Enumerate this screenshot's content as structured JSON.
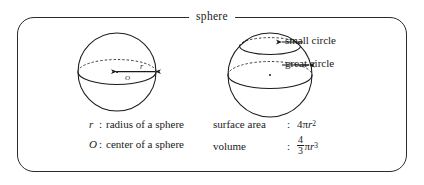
{
  "figure": {
    "legend_title": "sphere",
    "border_color": "#2a2a2a",
    "stroke_color": "#1a1a1a",
    "background": "#ffffff"
  },
  "callouts": [
    {
      "name": "small-circle",
      "label": "small circle"
    },
    {
      "name": "great-circle",
      "label": "great circle"
    }
  ],
  "definitions": [
    {
      "symbol": "r",
      "colon": ":",
      "text": "radius of a sphere"
    },
    {
      "symbol": "O",
      "colon": ":",
      "text": "center of a sphere"
    }
  ],
  "formulas": [
    {
      "name": "surface area",
      "colon": ":",
      "coefficient": "4",
      "pi": "π",
      "variable": "r",
      "exponent": "2"
    },
    {
      "name": "volume",
      "colon": ":",
      "numerator": "4",
      "denominator": "3",
      "pi": "π",
      "variable": "r",
      "exponent": "3"
    }
  ],
  "diagrams": {
    "left_sphere": {
      "radius_label": "r",
      "center_label": "O"
    },
    "right_sphere": {
      "small_circle_name": "small circle",
      "great_circle_name": "great circle"
    }
  }
}
